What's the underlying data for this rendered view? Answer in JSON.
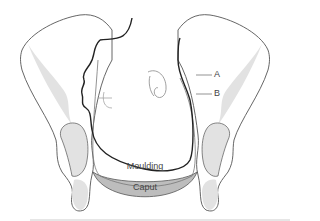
{
  "diagram": {
    "labels": {
      "a": "A",
      "b": "B",
      "moulding": "Moulding",
      "caput": "Caput"
    },
    "colors": {
      "outline": "#555555",
      "head_outline": "#222222",
      "bone_fill": "#e2e2e2",
      "caput_fill": "#bdbdbd",
      "background": "#ffffff"
    }
  }
}
